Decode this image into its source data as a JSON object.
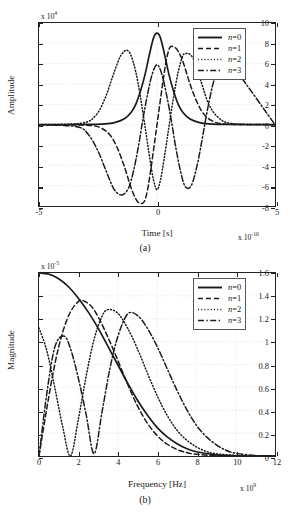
{
  "figure": {
    "panels": [
      {
        "id": "a",
        "caption": "(a)",
        "xlabel": "Time [s]",
        "ylabel": "Amplitude",
        "x_multiplier": "x 10",
        "x_multiplier_exp": "-10",
        "y_multiplier": "x 10",
        "y_multiplier_exp": "4"
      },
      {
        "id": "b",
        "caption": "(b)",
        "xlabel": "Frequency [Hz]",
        "ylabel": "Magnitude",
        "x_multiplier": "x 10",
        "x_multiplier_exp": "9",
        "y_multiplier": "x 10",
        "y_multiplier_exp": "-5"
      }
    ],
    "legend": {
      "entries": [
        {
          "label": "n=0",
          "style": "solid"
        },
        {
          "label": "n=1",
          "style": "dashed"
        },
        {
          "label": "n=2",
          "style": "dotted"
        },
        {
          "label": "n=3",
          "style": "dashdot"
        }
      ]
    }
  },
  "chart_data": [
    {
      "type": "line",
      "panel": "a",
      "title": "",
      "xlabel": "Time [s]",
      "ylabel": "Amplitude",
      "x_scale_factor": "1e-10",
      "y_scale_factor": "1e4",
      "xlim": [
        -5,
        5
      ],
      "ylim": [
        -8,
        10
      ],
      "xticks": [
        -5,
        0,
        5
      ],
      "yticks": [
        -8,
        -6,
        -4,
        -2,
        0,
        2,
        4,
        6,
        8,
        10
      ],
      "grid": true,
      "legend_position": "upper right",
      "description": "Gaussian derivative pulses of order n=0..3 in the time domain",
      "series": [
        {
          "name": "n=0",
          "style": "solid",
          "peak_value": 9.0,
          "peak_x": 0.0,
          "x": [
            -5,
            -3,
            -2.2,
            -1.8,
            -1.4,
            -1.1,
            -0.9,
            -0.7,
            -0.5,
            -0.35,
            -0.2,
            -0.1,
            0,
            0.1,
            0.2,
            0.35,
            0.5,
            0.7,
            0.9,
            1.1,
            1.4,
            1.8,
            2.2,
            3,
            5
          ],
          "y": [
            0,
            0.02,
            0.08,
            0.2,
            0.55,
            1.2,
            2.0,
            3.3,
            5.0,
            6.6,
            8.1,
            8.8,
            9.0,
            8.8,
            8.1,
            6.6,
            5.0,
            3.3,
            2.0,
            1.2,
            0.55,
            0.2,
            0.08,
            0.02,
            0
          ]
        },
        {
          "name": "n=1",
          "style": "dashed",
          "peak_value": 7.6,
          "peak_x": 0.55,
          "min_value": -7.7,
          "min_x": -0.55,
          "x": [
            -5,
            -3,
            -2.4,
            -2.0,
            -1.7,
            -1.4,
            -1.1,
            -0.9,
            -0.75,
            -0.55,
            -0.4,
            -0.25,
            -0.1,
            0,
            0.1,
            0.25,
            0.4,
            0.55,
            0.75,
            0.9,
            1.1,
            1.4,
            1.7,
            2.0,
            2.4,
            3,
            5
          ],
          "y": [
            0,
            -0.05,
            -0.3,
            -1.0,
            -2.2,
            -4.0,
            -6.2,
            -7.3,
            -7.7,
            -7.6,
            -6.4,
            -4.2,
            -1.7,
            0,
            1.7,
            4.2,
            6.4,
            7.6,
            7.6,
            7.2,
            6.2,
            4.0,
            2.2,
            1.0,
            0.3,
            0.05,
            0
          ]
        },
        {
          "name": "n=2",
          "style": "dotted",
          "peak_value": 7.3,
          "peak_x": -1.25,
          "min_value": -6.4,
          "min_x": 0.0,
          "x": [
            -5,
            -3.2,
            -2.6,
            -2.2,
            -1.9,
            -1.6,
            -1.4,
            -1.25,
            -1.1,
            -0.9,
            -0.7,
            -0.5,
            -0.3,
            -0.15,
            0,
            0.15,
            0.3,
            0.5,
            0.7,
            0.9,
            1.1,
            1.25,
            1.4,
            1.6,
            1.9,
            2.2,
            2.6,
            3.2,
            5
          ],
          "y": [
            0,
            0.15,
            0.9,
            2.6,
            4.6,
            6.5,
            7.2,
            7.3,
            6.8,
            5.2,
            2.7,
            -0.3,
            -3.4,
            -5.4,
            -6.4,
            -5.4,
            -3.4,
            -0.3,
            2.7,
            5.2,
            6.8,
            7.0,
            6.9,
            6.2,
            4.0,
            2.0,
            0.7,
            0.1,
            0
          ]
        },
        {
          "name": "n=3",
          "style": "dashdot",
          "peak_value": 7.1,
          "peak_x": 1.45,
          "min_value": -6.9,
          "min_x": -1.45,
          "x": [
            -5,
            -3.4,
            -2.9,
            -2.5,
            -2.2,
            -1.9,
            -1.7,
            -1.45,
            -1.2,
            -1.0,
            -0.8,
            -0.6,
            -0.4,
            -0.2,
            0,
            0.2,
            0.4,
            0.6,
            0.8,
            1.0,
            1.2,
            1.45,
            1.7,
            1.9,
            2.2,
            2.5,
            2.9,
            3.4,
            5
          ],
          "y": [
            0,
            -0.2,
            -1.0,
            -2.6,
            -4.3,
            -6.0,
            -6.7,
            -6.9,
            -6.2,
            -4.6,
            -2.3,
            0.5,
            3.0,
            5.0,
            5.9,
            5.0,
            3.0,
            0.5,
            -2.3,
            -4.6,
            -6.1,
            -6.0,
            -4.0,
            -1.6,
            2.2,
            5.0,
            6.6,
            5.2,
            0
          ]
        }
      ]
    },
    {
      "type": "line",
      "panel": "b",
      "title": "",
      "xlabel": "Frequency [Hz]",
      "ylabel": "Magnitude",
      "x_scale_factor": "1e9",
      "y_scale_factor": "1e-5",
      "xlim": [
        0,
        12
      ],
      "ylim": [
        0,
        1.6
      ],
      "xticks": [
        0,
        2,
        4,
        6,
        8,
        10,
        12
      ],
      "yticks": [
        0,
        0.2,
        0.4,
        0.6,
        0.8,
        1,
        1.2,
        1.4,
        1.6
      ],
      "grid": true,
      "legend_position": "upper right",
      "description": "Magnitude spectra of the Gaussian derivative pulses n=0..3",
      "series": [
        {
          "name": "n=0",
          "style": "solid",
          "peak_value": 1.6,
          "peak_x": 0.0,
          "x": [
            0,
            0.5,
            1,
            1.5,
            2,
            2.5,
            3,
            3.5,
            4,
            4.5,
            5,
            5.5,
            6,
            6.5,
            7,
            7.5,
            8,
            9,
            10,
            11,
            12
          ],
          "y": [
            1.6,
            1.59,
            1.55,
            1.48,
            1.38,
            1.26,
            1.12,
            0.96,
            0.8,
            0.64,
            0.49,
            0.36,
            0.25,
            0.17,
            0.11,
            0.065,
            0.037,
            0.01,
            0.002,
            0.0,
            0.0
          ]
        },
        {
          "name": "n=1",
          "style": "dashed",
          "peak_value": 1.36,
          "peak_x": 2.2,
          "x": [
            0,
            0.4,
            0.8,
            1.2,
            1.6,
            2.0,
            2.2,
            2.6,
            3.0,
            3.5,
            4,
            4.5,
            5,
            5.5,
            6,
            6.5,
            7,
            7.5,
            8,
            9,
            10,
            11,
            12
          ],
          "y": [
            0.0,
            0.42,
            0.8,
            1.08,
            1.26,
            1.35,
            1.36,
            1.32,
            1.22,
            1.04,
            0.84,
            0.63,
            0.44,
            0.29,
            0.18,
            0.105,
            0.058,
            0.03,
            0.015,
            0.003,
            0.0,
            0.0,
            0.0
          ]
        },
        {
          "name": "n=2",
          "style": "dotted",
          "peak_value": 1.28,
          "peak_x": 3.5,
          "local_peak_value": 1.12,
          "local_peak_x": 0.0,
          "null_x": 1.6,
          "x": [
            0,
            0.4,
            0.8,
            1.2,
            1.6,
            2.0,
            2.4,
            2.8,
            3.2,
            3.5,
            4.0,
            4.5,
            5.0,
            5.5,
            6.0,
            6.5,
            7.0,
            7.5,
            8.0,
            8.5,
            9,
            10,
            11,
            12
          ],
          "y": [
            1.12,
            0.92,
            0.6,
            0.26,
            0.0,
            0.32,
            0.7,
            1.02,
            1.22,
            1.28,
            1.25,
            1.12,
            0.94,
            0.73,
            0.53,
            0.36,
            0.23,
            0.14,
            0.08,
            0.04,
            0.02,
            0.005,
            0.0,
            0.0
          ]
        },
        {
          "name": "n=3",
          "style": "dashdot",
          "peak_value": 1.24,
          "peak_x": 4.5,
          "local_peak_value": 1.05,
          "local_peak_x": 1.25,
          "null_x": 2.8,
          "x": [
            0,
            0.4,
            0.8,
            1.25,
            1.6,
            2.0,
            2.4,
            2.8,
            3.2,
            3.6,
            4.0,
            4.5,
            5.0,
            5.5,
            6.0,
            6.5,
            7.0,
            7.5,
            8.0,
            8.5,
            9.0,
            9.5,
            10,
            11,
            12
          ],
          "y": [
            0.0,
            0.55,
            0.95,
            1.05,
            0.94,
            0.68,
            0.36,
            0.02,
            0.38,
            0.76,
            1.04,
            1.24,
            1.23,
            1.12,
            0.96,
            0.77,
            0.58,
            0.41,
            0.27,
            0.17,
            0.1,
            0.05,
            0.025,
            0.004,
            0.0
          ]
        }
      ]
    }
  ]
}
